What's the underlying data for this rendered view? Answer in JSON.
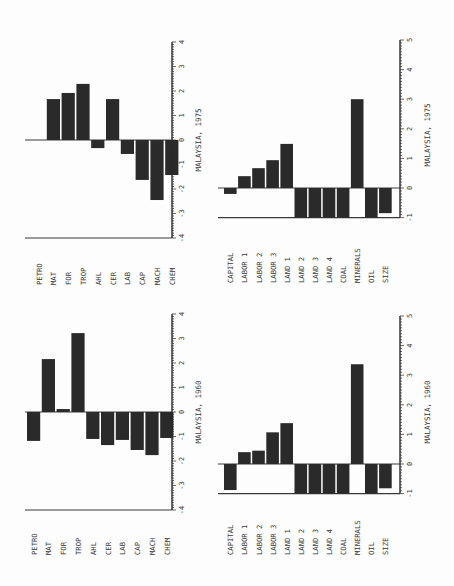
{
  "chart_data": [
    {
      "type": "bar",
      "title": "MALAYSIA, 1975",
      "orientation": "rotated page; bars vertical with category labels rotated",
      "categories": [
        "PETRO",
        "MAT",
        "FOR",
        "TROP",
        "AHL",
        "CER",
        "LAB",
        "CAP",
        "MACH",
        "CHEM"
      ],
      "values": [
        0.0,
        1.67,
        1.92,
        2.29,
        -0.33,
        1.67,
        -0.57,
        -1.63,
        -2.45,
        -1.43
      ],
      "ylim": [
        -4,
        4
      ],
      "ticks": [
        "-4",
        "-3",
        "-2",
        "-1",
        "0",
        "1",
        "2",
        "3",
        "4"
      ],
      "xlabel": "",
      "ylabel": "",
      "grid": false,
      "legend": null
    },
    {
      "type": "bar",
      "title": "MALAYSIA, 1975",
      "categories": [
        "CAPITAL",
        "LABOR 1",
        "LABOR 2",
        "LABOR 3",
        "LAND 1",
        "LAND 2",
        "LAND 3",
        "LAND 4",
        "COAL",
        "MINERALS",
        "OIL",
        "SIZE"
      ],
      "values": [
        -0.2,
        0.4,
        0.67,
        0.94,
        1.49,
        -1.0,
        -1.0,
        -1.0,
        -1.0,
        3.0,
        -1.0,
        -0.85
      ],
      "ylim": [
        -1,
        5
      ],
      "ticks": [
        "-1",
        "0",
        "1",
        "2",
        "3",
        "4",
        "5"
      ],
      "xlabel": "",
      "ylabel": "",
      "grid": false,
      "legend": null
    },
    {
      "type": "bar",
      "title": "MALAYSIA, 1960",
      "categories": [
        "PETRO",
        "MAT",
        "FOR",
        "TROP",
        "AHL",
        "CER",
        "LAB",
        "CAP",
        "MACH",
        "CHEM"
      ],
      "values": [
        -1.18,
        2.16,
        0.12,
        3.22,
        -1.1,
        -1.35,
        -1.14,
        -1.55,
        -1.76,
        -1.06
      ],
      "ylim": [
        -4,
        4
      ],
      "ticks": [
        "-4",
        "-3",
        "-2",
        "-1",
        "0",
        "1",
        "2",
        "3",
        "4"
      ],
      "xlabel": "",
      "ylabel": "",
      "grid": false,
      "legend": null
    },
    {
      "type": "bar",
      "title": "MALAYSIA, 1960",
      "categories": [
        "CAPITAL",
        "LABOR 1",
        "LABOR 2",
        "LABOR 3",
        "LAND 1",
        "LAND 2",
        "LAND 3",
        "LAND 4",
        "COAL",
        "MINERALS",
        "OIL",
        "SIZE"
      ],
      "values": [
        -0.88,
        0.4,
        0.45,
        1.07,
        1.38,
        -1.0,
        -1.0,
        -1.0,
        -1.0,
        3.37,
        -1.0,
        -0.82
      ],
      "ylim": [
        -1,
        5
      ],
      "ticks": [
        "-1",
        "0",
        "1",
        "2",
        "3",
        "4",
        "5"
      ],
      "xlabel": "",
      "ylabel": "",
      "grid": false,
      "legend": null
    }
  ],
  "layout": {
    "panels": [
      {
        "name": "trade-1975",
        "x0": 32,
        "barW": 13.2,
        "gap": 1.6,
        "axisX": 172,
        "zeroY": 140,
        "pxPerUnit": 24.5,
        "baseY": 238,
        "labelY": 285,
        "titleX": 201,
        "titleY": 140,
        "frameLeftX": 25,
        "frameTopY": 42
      },
      {
        "name": "factors-1975",
        "x0": 224,
        "barW": 12.6,
        "gap": 1.5,
        "axisX": 400,
        "zeroY": 188,
        "pxPerUnit": 29.6,
        "baseY": 218,
        "labelY": 283,
        "titleX": 430,
        "titleY": 135,
        "frameLeftX": 218,
        "frameTopY": 40
      },
      {
        "name": "trade-1960",
        "x0": 27,
        "barW": 13.2,
        "gap": 1.6,
        "axisX": 172,
        "zeroY": 412,
        "pxPerUnit": 24.5,
        "baseY": 510,
        "labelY": 555,
        "titleX": 201,
        "titleY": 412,
        "frameLeftX": 25,
        "frameTopY": 314
      },
      {
        "name": "factors-1960",
        "x0": 224,
        "barW": 12.6,
        "gap": 1.5,
        "axisX": 400,
        "zeroY": 464,
        "pxPerUnit": 29.6,
        "baseY": 494,
        "labelY": 555,
        "titleX": 430,
        "titleY": 412,
        "frameLeftX": 218,
        "frameTopY": 316
      }
    ]
  }
}
